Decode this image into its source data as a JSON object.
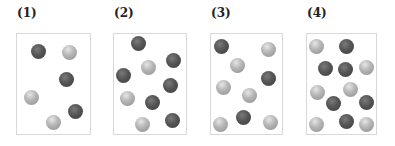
{
  "panels": [
    {
      "label": "(1)",
      "box": {
        "left": 16,
        "width": 75
      },
      "balls": [
        {
          "type": "dark",
          "x": 38,
          "y": 51
        },
        {
          "type": "light",
          "x": 69,
          "y": 52
        },
        {
          "type": "dark",
          "x": 66,
          "y": 79
        },
        {
          "type": "light",
          "x": 31,
          "y": 97
        },
        {
          "type": "dark",
          "x": 75,
          "y": 111
        },
        {
          "type": "light",
          "x": 53,
          "y": 122
        }
      ]
    },
    {
      "label": "(2)",
      "box": {
        "left": 113,
        "width": 74
      },
      "balls": [
        {
          "type": "dark",
          "x": 138,
          "y": 43
        },
        {
          "type": "light",
          "x": 148,
          "y": 67
        },
        {
          "type": "dark",
          "x": 173,
          "y": 60
        },
        {
          "type": "dark",
          "x": 123,
          "y": 75
        },
        {
          "type": "dark",
          "x": 170,
          "y": 85
        },
        {
          "type": "light",
          "x": 127,
          "y": 98
        },
        {
          "type": "dark",
          "x": 152,
          "y": 102
        },
        {
          "type": "light",
          "x": 142,
          "y": 124
        },
        {
          "type": "dark",
          "x": 172,
          "y": 120
        }
      ]
    },
    {
      "label": "(3)",
      "box": {
        "left": 210,
        "width": 73
      },
      "balls": [
        {
          "type": "dark",
          "x": 221,
          "y": 46
        },
        {
          "type": "light",
          "x": 268,
          "y": 49
        },
        {
          "type": "light",
          "x": 237,
          "y": 65
        },
        {
          "type": "dark",
          "x": 268,
          "y": 78
        },
        {
          "type": "light",
          "x": 223,
          "y": 87
        },
        {
          "type": "light",
          "x": 249,
          "y": 95
        },
        {
          "type": "dark",
          "x": 243,
          "y": 117
        },
        {
          "type": "light",
          "x": 220,
          "y": 124
        },
        {
          "type": "light",
          "x": 270,
          "y": 122
        }
      ]
    },
    {
      "label": "(4)",
      "box": {
        "left": 306,
        "width": 71
      },
      "balls": [
        {
          "type": "light",
          "x": 316,
          "y": 46
        },
        {
          "type": "dark",
          "x": 346,
          "y": 46
        },
        {
          "type": "dark",
          "x": 325,
          "y": 68
        },
        {
          "type": "dark",
          "x": 345,
          "y": 69
        },
        {
          "type": "light",
          "x": 366,
          "y": 67
        },
        {
          "type": "light",
          "x": 317,
          "y": 92
        },
        {
          "type": "light",
          "x": 350,
          "y": 89
        },
        {
          "type": "dark",
          "x": 333,
          "y": 103
        },
        {
          "type": "dark",
          "x": 366,
          "y": 102
        },
        {
          "type": "light",
          "x": 316,
          "y": 124
        },
        {
          "type": "dark",
          "x": 346,
          "y": 121
        },
        {
          "type": "light",
          "x": 366,
          "y": 124
        }
      ]
    }
  ],
  "colors": {
    "dark_ball": "#4a4a4a",
    "light_ball": "#b0b0b0",
    "border": "#d8d8d8"
  }
}
